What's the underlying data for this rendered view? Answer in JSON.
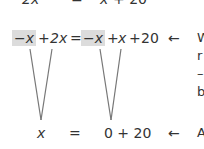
{
  "equations": {
    "line1": {
      "left": "2x",
      "eq": "=",
      "right_var": "x",
      "right_rest": "+ 20"
    },
    "line2": {
      "term1": "−x",
      "op1": "+",
      "term2": "2x",
      "eq": "=",
      "term3": "−x",
      "op2": "+",
      "term4": "x",
      "op3": "+",
      "const": "20",
      "arrow": "←"
    },
    "line3": {
      "left": "x",
      "eq": "=",
      "right": "0 + 20",
      "arrow": "←"
    }
  },
  "annotations": {
    "line2_note": [
      "W",
      "r",
      "–",
      "b"
    ],
    "line3_note": "A"
  },
  "colors": {
    "highlight": "#dcdcdc",
    "text": "#333333",
    "line": "#777777"
  }
}
